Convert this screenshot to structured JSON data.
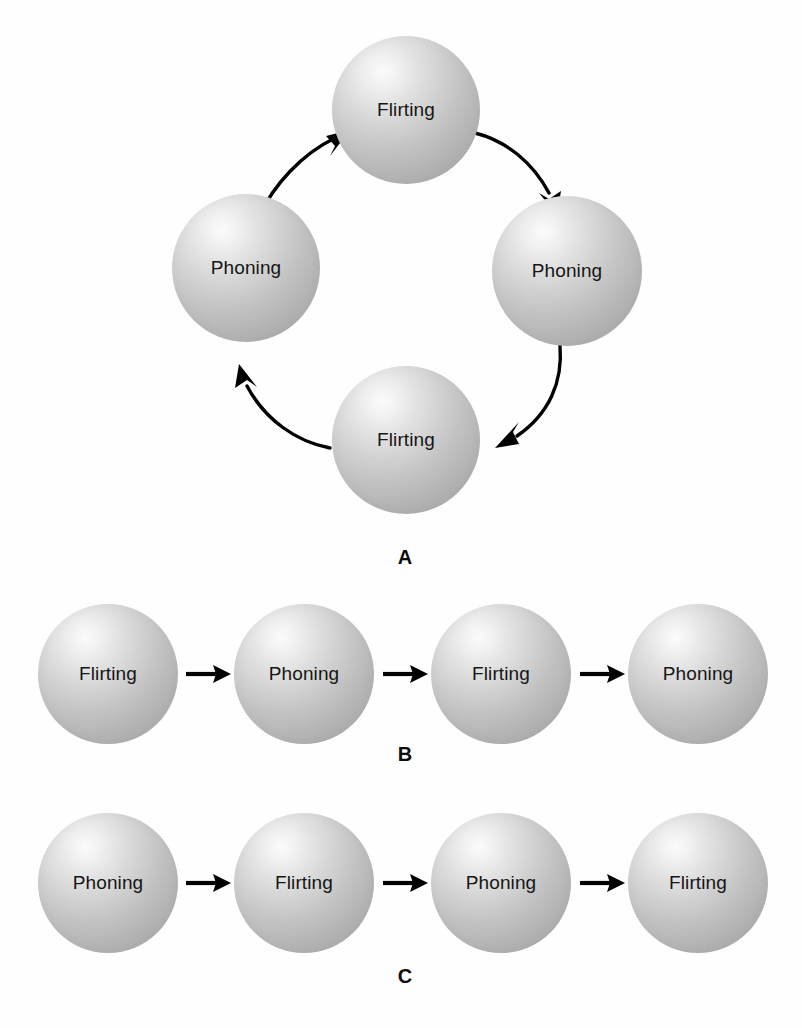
{
  "figure": {
    "background_color": "#ffffff",
    "node_fill_color": "#c2c2c2",
    "arrow_color": "#000000",
    "label_text_color": "#161616"
  },
  "panels": [
    {
      "id": "A",
      "caption": "A",
      "layout": "cycle",
      "nodes": [
        {
          "label": "Flirting",
          "position": "top"
        },
        {
          "label": "Phoning",
          "position": "right"
        },
        {
          "label": "Flirting",
          "position": "bottom"
        },
        {
          "label": "Phoning",
          "position": "left"
        }
      ],
      "arrows": [
        {
          "from": "Flirting",
          "to": "Phoning",
          "style": "curved",
          "direction": "top-to-right"
        },
        {
          "from": "Phoning",
          "to": "Flirting",
          "style": "curved",
          "direction": "right-to-bottom"
        },
        {
          "from": "Flirting",
          "to": "Phoning",
          "style": "curved",
          "direction": "bottom-to-left"
        },
        {
          "from": "Phoning",
          "to": "Flirting",
          "style": "curved",
          "direction": "left-to-top"
        }
      ]
    },
    {
      "id": "B",
      "caption": "B",
      "layout": "linear",
      "nodes": [
        {
          "label": "Flirting"
        },
        {
          "label": "Phoning"
        },
        {
          "label": "Flirting"
        },
        {
          "label": "Phoning"
        }
      ],
      "arrows": [
        {
          "from": "Flirting",
          "to": "Phoning",
          "style": "straight",
          "direction": "right"
        },
        {
          "from": "Phoning",
          "to": "Flirting",
          "style": "straight",
          "direction": "right"
        },
        {
          "from": "Flirting",
          "to": "Phoning",
          "style": "straight",
          "direction": "right"
        }
      ]
    },
    {
      "id": "C",
      "caption": "C",
      "layout": "linear",
      "nodes": [
        {
          "label": "Phoning"
        },
        {
          "label": "Flirting"
        },
        {
          "label": "Phoning"
        },
        {
          "label": "Flirting"
        }
      ],
      "arrows": [
        {
          "from": "Phoning",
          "to": "Flirting",
          "style": "straight",
          "direction": "right"
        },
        {
          "from": "Flirting",
          "to": "Phoning",
          "style": "straight",
          "direction": "right"
        },
        {
          "from": "Phoning",
          "to": "Flirting",
          "style": "straight",
          "direction": "right"
        }
      ]
    }
  ]
}
